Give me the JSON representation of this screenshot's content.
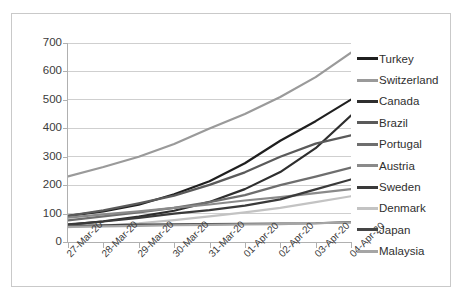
{
  "chart_data": {
    "type": "line",
    "title": "",
    "xlabel": "",
    "ylabel": "",
    "ylim": [
      0,
      700
    ],
    "ytick_step": 100,
    "yticks": [
      "700",
      "600",
      "500",
      "400",
      "300",
      "200",
      "100",
      "0"
    ],
    "grid": true,
    "legend_position": "right",
    "categories": [
      "27-Mar-20",
      "28-Mar-20",
      "29-Mar-20",
      "30-Mar-20",
      "31-Mar-20",
      "01-Apr-20",
      "02-Apr-20",
      "03-Apr-20",
      "04-Apr-20"
    ],
    "series": [
      {
        "name": "Turkey",
        "color": "#1f1f1f",
        "values": [
          92,
          108,
          131,
          168,
          214,
          277,
          356,
          425,
          501
        ]
      },
      {
        "name": "Switzerland",
        "color": "#9a9a9a",
        "values": [
          231,
          264,
          300,
          345,
          399,
          450,
          510,
          580,
          666
        ]
      },
      {
        "name": "Canada",
        "color": "#2e2e2e",
        "values": [
          60,
          73,
          89,
          110,
          141,
          186,
          246,
          330,
          445
        ]
      },
      {
        "name": "Brazil",
        "color": "#5a5a5a",
        "values": [
          92,
          111,
          136,
          163,
          201,
          245,
          300,
          346,
          375
        ]
      },
      {
        "name": "Portugal",
        "color": "#6e6e6e",
        "values": [
          76,
          90,
          104,
          120,
          140,
          165,
          200,
          230,
          262
        ]
      },
      {
        "name": "Austria",
        "color": "#8a8a8a",
        "values": [
          86,
          97,
          108,
          120,
          132,
          146,
          158,
          172,
          186
        ]
      },
      {
        "name": "Sweden",
        "color": "#3a3a3a",
        "values": [
          62,
          72,
          85,
          100,
          112,
          128,
          150,
          185,
          220
        ]
      },
      {
        "name": "Denmark",
        "color": "#c3c3c3",
        "values": [
          52,
          58,
          66,
          77,
          90,
          104,
          120,
          140,
          161
        ]
      },
      {
        "name": "Japan",
        "color": "#454545",
        "values": [
          57,
          59,
          61,
          62,
          63,
          64,
          65,
          66,
          70
        ]
      },
      {
        "name": "Malaysia",
        "color": "#a5a5a5",
        "values": [
          53,
          55,
          57,
          59,
          60,
          62,
          63,
          66,
          69
        ]
      }
    ]
  }
}
